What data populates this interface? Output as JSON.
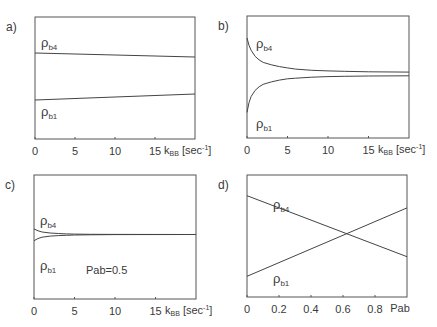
{
  "chart_data": [
    {
      "id": "a",
      "type": "line",
      "panel_label": "a)",
      "xlabel_main": "k",
      "xlabel_sub": "BB",
      "xlabel_unit": " [sec",
      "xlabel_unit_sup": "-1",
      "xlabel_unit_close": "]",
      "xlim": [
        0,
        20
      ],
      "ylim": [
        0,
        1
      ],
      "xticks": [
        0,
        5,
        10,
        15
      ],
      "xtick_labels": [
        "0",
        "5",
        "10",
        "15"
      ],
      "series": [
        {
          "name": "ρb4",
          "label_main": "ρ",
          "label_sub": "b4",
          "x": [
            0,
            20
          ],
          "y": [
            0.705,
            0.672
          ]
        },
        {
          "name": "ρb1",
          "label_main": "ρ",
          "label_sub": "b1",
          "x": [
            0,
            20
          ],
          "y": [
            0.32,
            0.369
          ]
        }
      ],
      "annotation": ""
    },
    {
      "id": "b",
      "type": "line",
      "panel_label": "b)",
      "xlabel_main": "k",
      "xlabel_sub": "BB",
      "xlabel_unit": " [sec",
      "xlabel_unit_sup": "-1",
      "xlabel_unit_close": "]",
      "xlim": [
        0,
        20
      ],
      "ylim": [
        0,
        1
      ],
      "xticks": [
        0,
        5,
        10,
        15
      ],
      "xtick_labels": [
        "0",
        "5",
        "10",
        "15"
      ],
      "series": [
        {
          "name": "ρb4",
          "label_main": "ρ",
          "label_sub": "b4",
          "x": [
            0,
            0.25,
            0.5,
            1,
            1.5,
            2,
            3,
            4,
            5,
            6,
            8,
            10,
            12,
            15,
            20
          ],
          "y": [
            0.82,
            0.76,
            0.72,
            0.67,
            0.64,
            0.62,
            0.6,
            0.585,
            0.575,
            0.565,
            0.555,
            0.55,
            0.547,
            0.543,
            0.54
          ]
        },
        {
          "name": "ρb1",
          "label_main": "ρ",
          "label_sub": "b1",
          "x": [
            0,
            0.25,
            0.5,
            1,
            1.5,
            2,
            3,
            4,
            5,
            6,
            8,
            10,
            12,
            15,
            20
          ],
          "y": [
            0.21,
            0.29,
            0.34,
            0.39,
            0.42,
            0.44,
            0.46,
            0.475,
            0.485,
            0.49,
            0.498,
            0.503,
            0.506,
            0.508,
            0.51
          ]
        }
      ],
      "annotation": ""
    },
    {
      "id": "c",
      "type": "line",
      "panel_label": "c)",
      "xlabel_main": "k",
      "xlabel_sub": "BB",
      "xlabel_unit": " [sec",
      "xlabel_unit_sup": "-1",
      "xlabel_unit_close": "]",
      "xlim": [
        0,
        20
      ],
      "ylim": [
        0,
        1
      ],
      "xticks": [
        0,
        5,
        10,
        15
      ],
      "xtick_labels": [
        "0",
        "5",
        "10",
        "15"
      ],
      "series": [
        {
          "name": "ρb4",
          "label_main": "ρ",
          "label_sub": "b4",
          "x": [
            0,
            0.5,
            1,
            2,
            3,
            4,
            5,
            7,
            10,
            20
          ],
          "y": [
            0.565,
            0.55,
            0.54,
            0.532,
            0.528,
            0.525,
            0.523,
            0.522,
            0.521,
            0.52
          ]
        },
        {
          "name": "ρb1",
          "label_main": "ρ",
          "label_sub": "b1",
          "x": [
            0,
            0.5,
            1,
            2,
            3,
            4,
            5,
            7,
            10,
            20
          ],
          "y": [
            0.47,
            0.488,
            0.498,
            0.507,
            0.511,
            0.514,
            0.516,
            0.518,
            0.519,
            0.52
          ]
        }
      ],
      "annotation": "Pab=0.5"
    },
    {
      "id": "d",
      "type": "line",
      "panel_label": "d)",
      "xlabel_main": "Pab",
      "xlabel_sub": "",
      "xlabel_unit": "",
      "xlabel_unit_sup": "",
      "xlabel_unit_close": "",
      "xlim": [
        0,
        1
      ],
      "ylim": [
        0,
        1
      ],
      "xticks": [
        0,
        0.2,
        0.4,
        0.6,
        0.8
      ],
      "xtick_labels": [
        "0",
        "0.2",
        "0.4",
        "0.6",
        "0.8"
      ],
      "series": [
        {
          "name": "ρb4",
          "label_main": "ρ",
          "label_sub": "b4",
          "x": [
            0,
            1
          ],
          "y": [
            0.83,
            0.33
          ]
        },
        {
          "name": "ρb1",
          "label_main": "ρ",
          "label_sub": "b1",
          "x": [
            0,
            1
          ],
          "y": [
            0.17,
            0.73
          ]
        }
      ],
      "annotation": ""
    }
  ]
}
